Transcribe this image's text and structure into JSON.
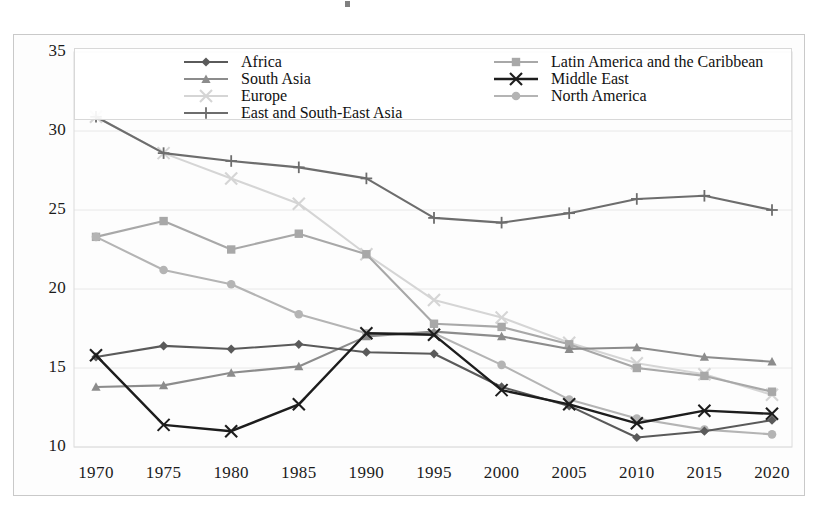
{
  "chart_data": {
    "type": "line",
    "title": "",
    "subtitle": "",
    "xlabel": "",
    "ylabel": "",
    "x": [
      1970,
      1975,
      1980,
      1985,
      1990,
      1995,
      2000,
      2005,
      2010,
      2015,
      2020
    ],
    "xtick_labels": [
      "1970",
      "1975",
      "1980",
      "1985",
      "1990",
      "1995",
      "2000",
      "2005",
      "2010",
      "2015",
      "2020"
    ],
    "ytick_labels": [
      "35",
      "30",
      "25",
      "20",
      "15",
      "10"
    ],
    "ytick_values": [
      35,
      30,
      25,
      20,
      15,
      10
    ],
    "xlim": [
      1970,
      2020
    ],
    "ylim": [
      10,
      35
    ],
    "grid": true,
    "grid_axis": "y",
    "legend_position": "top-inside",
    "legend_columns": 2,
    "series": [
      {
        "name": "Africa",
        "marker": "diamond",
        "color": "#5a5a5a",
        "values": [
          15.7,
          16.4,
          16.2,
          16.5,
          16.0,
          15.9,
          13.8,
          12.6,
          10.6,
          11.0,
          11.7
        ]
      },
      {
        "name": "South Asia",
        "marker": "triangle",
        "color": "#8c8c8c",
        "values": [
          13.8,
          13.9,
          14.7,
          15.1,
          17.0,
          17.3,
          17.0,
          16.2,
          16.3,
          15.7,
          15.4
        ]
      },
      {
        "name": "Europe",
        "marker": "cross",
        "color": "#d5d5d5",
        "values": [
          30.9,
          28.6,
          27.0,
          25.4,
          22.2,
          19.3,
          18.2,
          16.6,
          15.3,
          14.6,
          13.3
        ]
      },
      {
        "name": "East and South-East Asia",
        "marker": "plus",
        "color": "#6d6d6d",
        "values": [
          30.9,
          28.6,
          28.1,
          27.7,
          27.0,
          24.5,
          24.2,
          24.8,
          25.7,
          25.9,
          25.0
        ]
      },
      {
        "name": "Latin America and the Caribbean",
        "marker": "square",
        "color": "#a8a8a8",
        "values": [
          23.3,
          24.3,
          22.5,
          23.5,
          22.2,
          17.8,
          17.6,
          16.5,
          15.0,
          14.5,
          13.5
        ]
      },
      {
        "name": "Middle East",
        "marker": "x",
        "color": "#1d1d1d",
        "values": [
          15.8,
          11.4,
          11.0,
          12.7,
          17.2,
          17.1,
          13.6,
          12.7,
          11.5,
          12.3,
          12.1
        ]
      },
      {
        "name": "North America",
        "marker": "circle",
        "color": "#b4b4b4",
        "values": [
          23.3,
          21.2,
          20.3,
          18.4,
          17.2,
          17.2,
          15.2,
          13.0,
          11.8,
          11.1,
          10.8
        ]
      }
    ]
  },
  "legend": {
    "left_column": [
      {
        "label": "Africa"
      },
      {
        "label": "South Asia"
      },
      {
        "label": "Europe"
      },
      {
        "label": "East and South-East Asia"
      }
    ],
    "right_column": [
      {
        "label": "Latin America and the Caribbean"
      },
      {
        "label": "Middle East"
      },
      {
        "label": "North America"
      }
    ]
  },
  "colors": {
    "frame_border": "#c9c9c9",
    "gridline": "#e8e8e8",
    "background": "#ffffff",
    "plot_background": "#fdfdfd",
    "tick_text": "#1b1b1b"
  }
}
